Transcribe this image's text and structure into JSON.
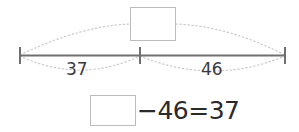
{
  "worksheet": {
    "type": "bar-model-number-line",
    "title_text": "",
    "number_line": {
      "left_tick_label": "",
      "center_tick_label": "",
      "right_tick_label": "",
      "color": "#707070"
    },
    "segments": [
      {
        "name": "left-segment",
        "label": "37"
      },
      {
        "name": "right-segment",
        "label": "46"
      }
    ],
    "whole": {
      "name": "total-answer-box",
      "value": "",
      "placeholder": "",
      "border_color": "#bcbcbc"
    },
    "equation": {
      "unknown_box_value": "",
      "operator_minus": "−",
      "subtrahend": "46",
      "equals": "=",
      "result": "37",
      "full_text": "−46=37"
    },
    "colors": {
      "line": "#707070",
      "dotted_arc": "#c9c9c9",
      "box_border": "#bcbcbc",
      "text": "#2a2a2a",
      "background": "#ffffff"
    }
  }
}
